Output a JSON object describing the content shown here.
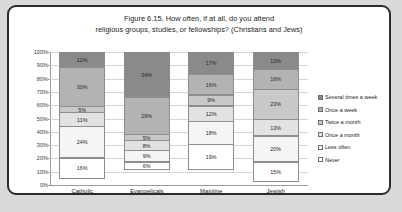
{
  "frame": {
    "border_color": "#2b2b2b",
    "background": "#ffffff",
    "page_background": "#d9d9d9"
  },
  "chart_data": {
    "type": "bar",
    "subtype": "stacked-percent-column",
    "title": "Figure 6.15, How often, if at all, do you attend religious groups, studies, or fellowships? (Christians and Jews)",
    "title_lines": [
      "Figure 6.15, How often, if at all, do you attend",
      "religious groups, studies, or fellowships? (Christians and Jews)"
    ],
    "xlabel": "",
    "ylabel": "",
    "ylim": [
      0,
      100
    ],
    "yticks": [
      "0%",
      "10%",
      "20%",
      "30%",
      "40%",
      "50%",
      "60%",
      "70%",
      "80%",
      "90%",
      "100%"
    ],
    "grid": true,
    "legend_position": "right",
    "categories": [
      "Catholic",
      "Evangelicals",
      "Mainline",
      "Jewish"
    ],
    "series": [
      {
        "name": "Several times a week",
        "color": "#8a8a8a",
        "values": [
          12,
          34,
          17,
          13
        ],
        "labels": [
          "12%",
          "34%",
          "17%",
          "13%"
        ]
      },
      {
        "name": "Once a week",
        "color": "#b3b3b3",
        "values": [
          30,
          29,
          16,
          16
        ],
        "labels": [
          "30%",
          "29%",
          "16%",
          "16%"
        ]
      },
      {
        "name": "Twice a month",
        "color": "#c9c9c9",
        "values": [
          5,
          5,
          9,
          23
        ],
        "labels": [
          "5%",
          "5%",
          "9%",
          "23%"
        ]
      },
      {
        "name": "Once a month",
        "color": "#e2e2e2",
        "values": [
          11,
          8,
          12,
          13
        ],
        "labels": [
          "11%",
          "8%",
          "12%",
          "13%"
        ]
      },
      {
        "name": "Less often",
        "color": "#f5f5f5",
        "values": [
          24,
          9,
          18,
          20
        ],
        "labels": [
          "24%",
          "9%",
          "18%",
          "20%"
        ]
      },
      {
        "name": "Never",
        "color": "#ffffff",
        "values": [
          16,
          6,
          19,
          15
        ],
        "labels": [
          "16%",
          "6%",
          "19%",
          "15%"
        ]
      }
    ]
  }
}
